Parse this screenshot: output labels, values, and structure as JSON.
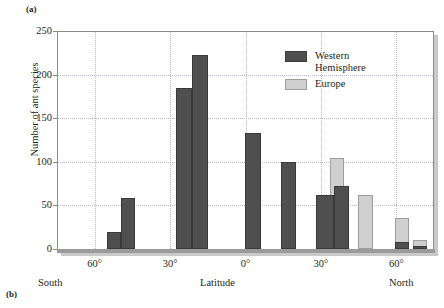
{
  "panels": {
    "a_label": "(a)",
    "b_label": "(b)"
  },
  "colors": {
    "western_hemisphere": "#4f4f4f",
    "europe": "#cfcfcf",
    "axis": "#8a8a8a",
    "gridline": "#b9b9c4",
    "text": "#231f20"
  },
  "legend": {
    "position": "top-right-inside",
    "entries": [
      {
        "label": "Western\nHemisphere",
        "color": "#4f4f4f",
        "swatch": "western"
      },
      {
        "label": "Europe",
        "color": "#cfcfcf",
        "swatch": "europe"
      }
    ]
  },
  "axes": {
    "y_title": "Number of ant species",
    "y_ticks": [
      "0",
      "50",
      "100",
      "150",
      "200",
      "250"
    ],
    "x_ticks": [
      "60°",
      "30°",
      "0°",
      "30°",
      "60°"
    ],
    "x_label_left": "South",
    "x_label_center": "Latitude",
    "x_label_right": "North"
  },
  "chart_data": {
    "type": "bar",
    "title": "",
    "subtitle": "",
    "xlabel": "Latitude",
    "ylabel": "Number of ant species",
    "xlim": [
      -75,
      75
    ],
    "ylim": [
      0,
      250
    ],
    "ytick_step": 50,
    "xtick_values": [
      -60,
      -30,
      0,
      30,
      60
    ],
    "xtick_labels": [
      "60°",
      "30°",
      "0°",
      "30°",
      "60°"
    ],
    "ytick_values": [
      0,
      50,
      100,
      150,
      200,
      250
    ],
    "ytick_labels": [
      "0",
      "50",
      "100",
      "150",
      "200",
      "250"
    ],
    "grid": true,
    "grid_style": "dotted",
    "legend_position": "upper right",
    "x_axis_note": "Latitude increases from South (left) to North (right)",
    "series": [
      {
        "name": "Western Hemisphere",
        "color": "#4f4f4f",
        "points": [
          {
            "latitude": -48,
            "value": 20
          },
          {
            "latitude": -43,
            "value": 58
          },
          {
            "latitude": -30,
            "value": 185
          },
          {
            "latitude": -25,
            "value": 222
          },
          {
            "latitude": 9,
            "value": 133
          },
          {
            "latitude": 19,
            "value": 100
          },
          {
            "latitude": 33,
            "value": 62
          },
          {
            "latitude": 38,
            "value": 72
          },
          {
            "latitude": 57,
            "value": 8
          },
          {
            "latitude": 64,
            "value": 4
          }
        ]
      },
      {
        "name": "Europe",
        "color": "#cfcfcf",
        "points": [
          {
            "latitude": 33,
            "value": 104
          },
          {
            "latitude": 38,
            "value": 62
          },
          {
            "latitude": 47,
            "value": 62
          },
          {
            "latitude": 57,
            "value": 35
          },
          {
            "latitude": 64,
            "value": 10
          }
        ]
      }
    ]
  },
  "bars": [
    {
      "name": "wh-45s-a",
      "series": "western",
      "left": 107,
      "width": 14,
      "value": 20
    },
    {
      "name": "wh-45s-b",
      "series": "western",
      "left": 121,
      "width": 14,
      "value": 58
    },
    {
      "name": "wh-30s-a",
      "series": "western",
      "left": 176,
      "width": 16,
      "value": 185
    },
    {
      "name": "wh-30s-b",
      "series": "western",
      "left": 192,
      "width": 16,
      "value": 222
    },
    {
      "name": "wh-10n",
      "series": "western",
      "left": 245,
      "width": 16,
      "value": 133
    },
    {
      "name": "wh-20n",
      "series": "western",
      "left": 281,
      "width": 15,
      "value": 100
    },
    {
      "name": "eu-33n",
      "series": "europe",
      "left": 330,
      "width": 14,
      "value": 104
    },
    {
      "name": "wh-33n",
      "series": "western",
      "left": 316,
      "width": 18,
      "value": 62
    },
    {
      "name": "wh-38n",
      "series": "western",
      "left": 334,
      "width": 15,
      "value": 72
    },
    {
      "name": "eu-47n",
      "series": "europe",
      "left": 358,
      "width": 15,
      "value": 62
    },
    {
      "name": "eu-57n",
      "series": "europe",
      "left": 395,
      "width": 14,
      "value": 35
    },
    {
      "name": "wh-57n",
      "series": "western",
      "left": 395,
      "width": 14,
      "value": 8
    },
    {
      "name": "eu-64n",
      "series": "europe",
      "left": 413,
      "width": 14,
      "value": 10
    },
    {
      "name": "wh-64n",
      "series": "western",
      "left": 413,
      "width": 14,
      "value": 4
    }
  ],
  "layout": {
    "plot_left": 57,
    "plot_top": 31,
    "plot_width": 377,
    "plot_height": 218,
    "baseline_y": 249,
    "y_max": 250
  }
}
